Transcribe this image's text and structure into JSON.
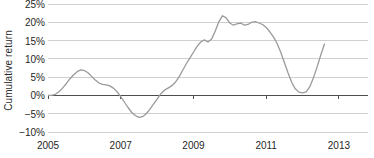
{
  "chart_data": {
    "type": "line",
    "title": "",
    "xlabel": "",
    "ylabel": "Cumulative return",
    "xlim": [
      2005,
      2013.8
    ],
    "ylim": [
      -10,
      25
    ],
    "grid": true,
    "grid_axis": "y",
    "legend": false,
    "zero_line": true,
    "line_color": "#9a9a9a",
    "grid_color": "#cfcfcf",
    "axis_color": "#4d4d4d",
    "ytick_labels": [
      "25%",
      "20%",
      "15%",
      "10%",
      "5%",
      "0%",
      "-5%",
      "-10%"
    ],
    "ytick_values": [
      25,
      20,
      15,
      10,
      5,
      0,
      -5,
      -10
    ],
    "xtick_labels": [
      "2005",
      "2007",
      "2009",
      "2011",
      "2013"
    ],
    "xtick_values": [
      2005,
      2007,
      2009,
      2011,
      2013
    ],
    "series": [
      {
        "name": "Cumulative return",
        "x": [
          2005.0,
          2005.1,
          2005.2,
          2005.3,
          2005.4,
          2005.5,
          2005.6,
          2005.7,
          2005.8,
          2005.9,
          2006.0,
          2006.1,
          2006.2,
          2006.3,
          2006.4,
          2006.5,
          2006.6,
          2006.7,
          2006.8,
          2006.9,
          2007.0,
          2007.1,
          2007.2,
          2007.3,
          2007.4,
          2007.5,
          2007.6,
          2007.7,
          2007.8,
          2007.9,
          2008.0,
          2008.1,
          2008.2,
          2008.3,
          2008.4,
          2008.5,
          2008.6,
          2008.7,
          2008.8,
          2008.9,
          2009.0,
          2009.1,
          2009.2,
          2009.3,
          2009.4,
          2009.5,
          2009.6,
          2009.7,
          2009.8,
          2009.9,
          2010.0,
          2010.1,
          2010.2,
          2010.3,
          2010.4,
          2010.5,
          2010.6,
          2010.7,
          2010.8,
          2010.9,
          2011.0,
          2011.1,
          2011.2,
          2011.3,
          2011.4,
          2011.5,
          2011.6,
          2011.7,
          2011.8,
          2011.9,
          2012.0,
          2012.1,
          2012.2,
          2012.3,
          2012.4,
          2012.5,
          2012.6
        ],
        "y": [
          0.0,
          0.0,
          0.3,
          1.0,
          2.0,
          3.2,
          4.5,
          5.6,
          6.5,
          7.0,
          6.8,
          6.2,
          5.2,
          4.2,
          3.4,
          3.0,
          2.9,
          2.6,
          2.0,
          1.0,
          -0.3,
          -1.8,
          -3.3,
          -4.6,
          -5.5,
          -6.0,
          -5.8,
          -5.0,
          -3.8,
          -2.4,
          -1.0,
          0.4,
          1.4,
          2.0,
          2.6,
          3.6,
          5.0,
          6.8,
          8.6,
          10.2,
          11.8,
          13.4,
          14.6,
          15.2,
          14.6,
          15.4,
          17.6,
          20.2,
          21.8,
          21.2,
          19.8,
          19.2,
          19.6,
          19.8,
          19.2,
          19.4,
          20.0,
          20.2,
          19.8,
          19.4,
          18.6,
          17.4,
          16.0,
          14.2,
          11.8,
          9.0,
          6.2,
          3.6,
          1.8,
          0.9,
          0.7,
          1.0,
          2.4,
          4.8,
          7.8,
          11.0,
          14.0
        ]
      }
    ]
  }
}
